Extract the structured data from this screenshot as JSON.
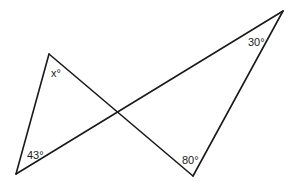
{
  "figure": {
    "type": "two triangles sharing vertical angles at an intersection",
    "stroke_color": "#1a1a1a",
    "background": "#ffffff",
    "vertices": {
      "top_left": [
        49,
        54
      ],
      "bottom_left": [
        16,
        174
      ],
      "top_right": [
        283,
        11
      ],
      "bottom_right": [
        193,
        176
      ]
    },
    "segments": [
      {
        "from": "bottom_left",
        "to": "top_left"
      },
      {
        "from": "top_left",
        "to": "bottom_right"
      },
      {
        "from": "bottom_left",
        "to": "top_right"
      },
      {
        "from": "top_right",
        "to": "bottom_right"
      }
    ]
  },
  "labels": {
    "x_angle": "x°",
    "bottom_left_angle": "43°",
    "top_right_angle": "30°",
    "bottom_right_angle": "80°"
  }
}
